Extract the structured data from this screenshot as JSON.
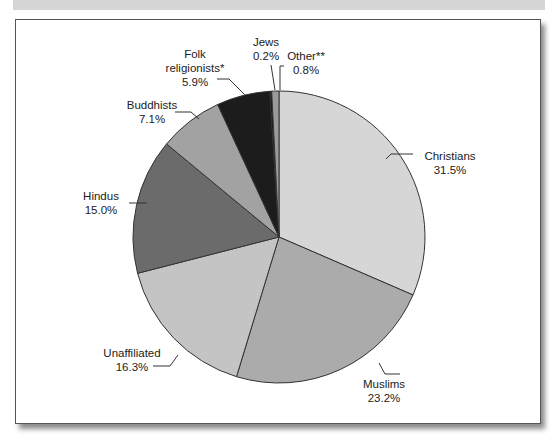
{
  "chart_data": {
    "type": "pie",
    "title": "",
    "start_angle_deg": 0,
    "direction": "clockwise",
    "slices": [
      {
        "label": "Christians",
        "value": 31.5,
        "display": "31.5%",
        "color": "#d6d6d6"
      },
      {
        "label": "Muslims",
        "value": 23.2,
        "display": "23.2%",
        "color": "#ababab"
      },
      {
        "label": "Unaffiliated",
        "value": 16.3,
        "display": "16.3%",
        "color": "#c4c4c4"
      },
      {
        "label": "Hindus",
        "value": 15.0,
        "display": "15.0%",
        "color": "#6b6b6b"
      },
      {
        "label": "Buddhists",
        "value": 7.1,
        "display": "7.1%",
        "color": "#a2a2a2"
      },
      {
        "label": "Folk religionists*",
        "value": 5.9,
        "display": "5.9%",
        "color": "#1c1c1c"
      },
      {
        "label": "Jews",
        "value": 0.2,
        "display": "0.2%",
        "color": "#0a0a0a"
      },
      {
        "label": "Other**",
        "value": 0.8,
        "display": "0.8%",
        "color": "#9a9a9a"
      }
    ]
  },
  "labels": {
    "christians": {
      "name": "Christians",
      "pct": "31.5%"
    },
    "muslims": {
      "name": "Muslims",
      "pct": "23.2%"
    },
    "unaffiliated": {
      "name": "Unaffiliated",
      "pct": "16.3%"
    },
    "hindus": {
      "name": "Hindus",
      "pct": "15.0%"
    },
    "buddhists": {
      "name": "Buddhists",
      "pct": "7.1%"
    },
    "folk": {
      "line1": "Folk",
      "line2": "religionists*",
      "pct": "5.9%"
    },
    "jews": {
      "name": "Jews",
      "pct": "0.2%"
    },
    "other": {
      "name": "Other**",
      "pct": "0.8%"
    }
  }
}
